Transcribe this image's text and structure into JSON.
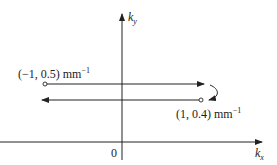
{
  "diagram": {
    "axes": {
      "x_label": "k",
      "x_sub": "x",
      "y_label": "k",
      "y_sub": "y",
      "origin_label": "0"
    },
    "points": [
      {
        "label": "(−1, 0.5) mm",
        "exp": "−1"
      },
      {
        "label": "(1, 0.4) mm",
        "exp": "−1"
      }
    ],
    "colors": {
      "line": "#222222",
      "background": "#ffffff"
    }
  }
}
